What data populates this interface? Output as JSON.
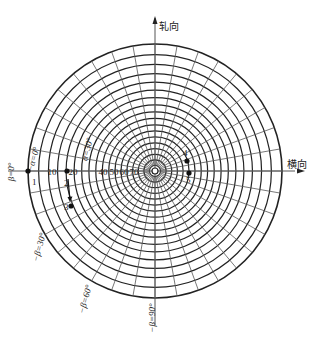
{
  "figure": {
    "type": "pole-figure-polar-net",
    "center": [
      155,
      171
    ],
    "outer_radius": 127,
    "axes": {
      "rolling_direction_label": "轧向",
      "transverse_direction_label": "横向"
    },
    "grid": {
      "alpha_step_deg": 5,
      "beta_step_deg": 10,
      "line_color": "#222222",
      "circle_stroke": "#222222",
      "radial_stroke": "#555555"
    },
    "alpha_tick_labels": [
      {
        "text": "10",
        "x": 52,
        "y": 175
      },
      {
        "text": "20",
        "x": 73,
        "y": 175
      },
      {
        "text": "40",
        "x": 103,
        "y": 175
      },
      {
        "text": "50",
        "x": 114,
        "y": 175
      },
      {
        "text": "60",
        "x": 124,
        "y": 175
      },
      {
        "text": "70",
        "x": 134,
        "y": 175
      }
    ],
    "angle_labels": [
      {
        "text": "−α=0°",
        "x": 36,
        "y": 160,
        "rotate": -75
      },
      {
        "text": "α=30°",
        "x": 90,
        "y": 150,
        "rotate": -75
      },
      {
        "text": "β=0°",
        "x": 14,
        "y": 172,
        "rotate": -90
      },
      {
        "text": "−β=30°",
        "x": 42,
        "y": 248,
        "rotate": -75
      },
      {
        "text": "−β=60°",
        "x": 88,
        "y": 300,
        "rotate": -75
      },
      {
        "text": "−β=90°",
        "x": 155,
        "y": 318,
        "rotate": -90
      }
    ],
    "points": [
      {
        "id": "1",
        "x": 28,
        "y": 171,
        "label_x": 32,
        "label_y": 185
      },
      {
        "id": "2",
        "x": 67,
        "y": 171,
        "label_x": 64,
        "label_y": 186
      },
      {
        "id": "3",
        "x": 71,
        "y": 206,
        "label_x": 64,
        "label_y": 210
      },
      {
        "id": "4",
        "x": 187,
        "y": 161,
        "label_x": 183,
        "label_y": 156
      },
      {
        "id": "5",
        "x": 189,
        "y": 173,
        "label_x": 186,
        "label_y": 183
      }
    ],
    "arrow": {
      "from": "2",
      "to": "3"
    }
  }
}
